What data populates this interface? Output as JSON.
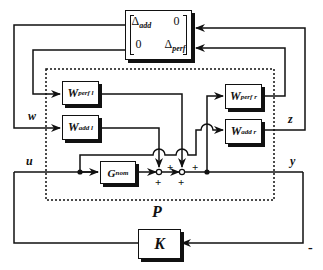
{
  "diagram": {
    "type": "block-diagram",
    "uncertainty_block": {
      "row1": [
        "Δadd",
        "0"
      ],
      "row2": [
        "0",
        "Δperf"
      ],
      "r1c1_main": "Δ",
      "r1c1_sub": "add",
      "r1c2": "0",
      "r2c1": "0",
      "r2c2_main": "Δ",
      "r2c2_sub": "perf"
    },
    "blocks": {
      "w_perf_l": {
        "main": "W",
        "sub": "perf l"
      },
      "w_add_l": {
        "main": "W",
        "sub": "add l"
      },
      "w_perf_r": {
        "main": "W",
        "sub": "perf r"
      },
      "w_add_r": {
        "main": "W",
        "sub": "add r"
      },
      "g_nom": {
        "main": "G",
        "sub": "nom"
      },
      "k": {
        "main": "K"
      }
    },
    "signals": {
      "w": "w",
      "z": "z",
      "u": "u",
      "y": "y"
    },
    "plant_label": "P",
    "signs": {
      "sum1_bottom": "+",
      "sum1_right": "+",
      "sum2_bottom": "+",
      "sum2_right": "+",
      "feedback": "-"
    },
    "colors": {
      "line": "#111111",
      "background": "#ffffff"
    }
  }
}
